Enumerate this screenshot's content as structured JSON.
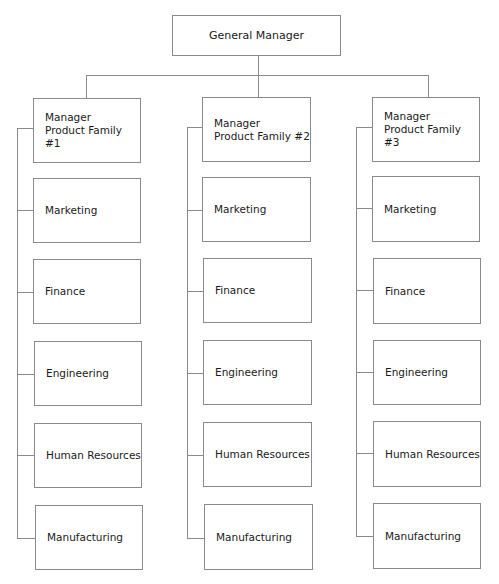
{
  "diagram": {
    "type": "org-chart",
    "root": {
      "label": "General Manager"
    },
    "columns": [
      {
        "manager": {
          "line1": "Manager",
          "line2": "Product Family #1"
        },
        "departments": [
          "Marketing",
          "Finance",
          "Engineering",
          "Human Resources",
          "Manufacturing"
        ]
      },
      {
        "manager": {
          "line1": "Manager",
          "line2": "Product Family #2"
        },
        "departments": [
          "Marketing",
          "Finance",
          "Engineering",
          "Human Resources",
          "Manufacturing"
        ]
      },
      {
        "manager": {
          "line1": "Manager",
          "line2": "Product Family #3"
        },
        "departments": [
          "Marketing",
          "Finance",
          "Engineering",
          "Human Resources",
          "Manufacturing"
        ]
      }
    ],
    "colors": {
      "line": "#8a8a8a",
      "text": "#1a1a1a",
      "background": "#ffffff"
    }
  }
}
